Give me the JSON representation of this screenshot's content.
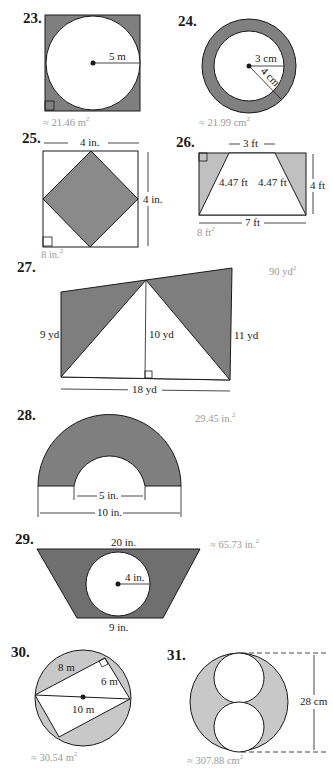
{
  "colors": {
    "shade_dark": "#7a7a7a",
    "shade_light": "#c4c4c4",
    "shade_mid": "#8f8f8f",
    "line": "#1a1a1a",
    "answer_text": "#9a9a9a"
  },
  "problems": [
    {
      "number": "23.",
      "description": "Square with inscribed circle, shaded corners",
      "labels": {
        "radius": "5 m"
      },
      "answer": "≈ 21.46 m",
      "answer_unit_exp": "2"
    },
    {
      "number": "24.",
      "description": "Annulus (ring) between two concentric circles",
      "labels": {
        "inner_radius": "3 cm",
        "outer_radius": "4 cm"
      },
      "answer": "≈ 21.99 cm",
      "answer_unit_exp": "2"
    },
    {
      "number": "25.",
      "description": "Square with inscribed rotated square (diamond) shaded",
      "labels": {
        "width": "4 in.",
        "height": "4 in."
      },
      "answer": "8 in.",
      "answer_unit_exp": "2"
    },
    {
      "number": "26.",
      "description": "Rectangle with trapezoid cut-out, shaded side triangles",
      "labels": {
        "top": "3 ft",
        "left_slant": "4.47 ft",
        "right_slant": "4.47 ft",
        "height": "4 ft",
        "bottom": "7 ft"
      },
      "answer": "8 ft",
      "answer_unit_exp": "2"
    },
    {
      "number": "27.",
      "description": "Quadrilateral with central white triangle, shaded side triangles",
      "labels": {
        "left": "9 yd",
        "middle": "10 yd",
        "right": "11 yd",
        "base": "18 yd"
      },
      "answer": "90 yd",
      "answer_unit_exp": "2"
    },
    {
      "number": "28.",
      "description": "Semicircular ring (half annulus)",
      "labels": {
        "inner_diameter": "5 in.",
        "outer_diameter": "10 in."
      },
      "answer": "29.45 in.",
      "answer_unit_exp": "2"
    },
    {
      "number": "29.",
      "description": "Trapezoid with circle cut-out",
      "labels": {
        "top": "20 in.",
        "radius": "4 in.",
        "bottom": "9 in."
      },
      "answer": "≈ 65.73 in.",
      "answer_unit_exp": "2"
    },
    {
      "number": "30.",
      "description": "Circle with inscribed rectangle, shaded segments",
      "labels": {
        "side_a": "8 m",
        "side_b": "6 m",
        "diameter": "10 m"
      },
      "answer": "≈ 30.54 m",
      "answer_unit_exp": "2"
    },
    {
      "number": "31.",
      "description": "Circle containing two stacked tangent circles",
      "labels": {
        "height": "28 cm"
      },
      "answer": "≈ 307.88 cm",
      "answer_unit_exp": "2"
    }
  ]
}
